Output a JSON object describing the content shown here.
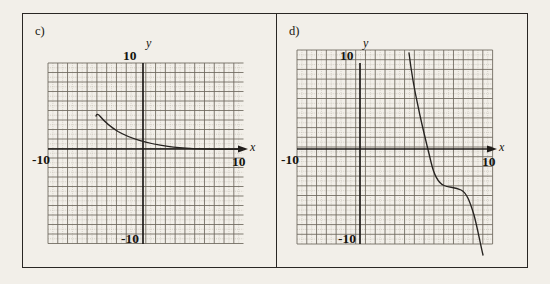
{
  "figure": {
    "background_color": "#f2efe9",
    "frame_color": "#2a2724",
    "curve_color": "#262320",
    "axis_color": "#1e1b18",
    "grid_major_color": "#6d675c",
    "grid_minor_color": "#b5afa2"
  },
  "panels": [
    {
      "id": "c",
      "label": "c)",
      "axis_labels": {
        "x": "x",
        "y": "y"
      },
      "ticks": {
        "x_min": "-10",
        "x_max": "10",
        "y_max": "10",
        "y_min": "-10"
      }
    },
    {
      "id": "d",
      "label": "d)",
      "axis_labels": {
        "x": "x",
        "y": "y"
      },
      "ticks": {
        "x_min": "-10",
        "x_max": "10",
        "y_max": "10",
        "y_min": "-10"
      }
    }
  ],
  "chart_data": [
    {
      "type": "line",
      "id": "c",
      "title": "c)",
      "xlabel": "x",
      "ylabel": "y",
      "xlim": [
        -10,
        10
      ],
      "ylim": [
        -10,
        10
      ],
      "grid": true,
      "grid_major_step": 2,
      "grid_minor_step": 1,
      "legend": "none",
      "description": "Decreasing concave-up curve beginning with a vertical tangent near x = -10 and falling slowly to the right, crossing below y = 0 near x = 10.",
      "x": [
        -9.9,
        -9.8,
        -9.5,
        -9.0,
        -8.0,
        -7.0,
        -6.0,
        -5.0,
        -4.0,
        -3.0,
        -2.0,
        -1.0,
        0.0,
        1.0,
        2.0,
        3.0,
        4.0,
        5.0,
        6.0,
        7.0,
        8.0,
        9.0,
        10.0
      ],
      "y": [
        6.6,
        6.2,
        5.7,
        5.2,
        4.6,
        4.1,
        3.7,
        3.4,
        3.0,
        2.7,
        2.4,
        2.1,
        1.8,
        1.6,
        1.3,
        1.1,
        0.9,
        0.7,
        0.5,
        0.3,
        0.2,
        0.1,
        0.0
      ]
    },
    {
      "type": "line",
      "id": "d",
      "title": "d)",
      "xlabel": "x",
      "ylabel": "y",
      "xlim": [
        -10,
        10
      ],
      "ylim": [
        -10,
        10
      ],
      "grid": true,
      "grid_major_step": 2,
      "grid_minor_step": 1,
      "legend": "none",
      "description": "Steeply decreasing curve with an inflection plateau near (3.5, -3); it falls from above y = 10 near x = 1.5 down through the plateau and then drops below y = -10 near x = 6.5.",
      "x": [
        1.4,
        1.6,
        1.8,
        2.0,
        2.2,
        2.4,
        2.6,
        2.8,
        3.0,
        3.2,
        3.4,
        3.6,
        3.8,
        4.0,
        4.4,
        4.8,
        5.2,
        5.6,
        6.0,
        6.3,
        6.5
      ],
      "y": [
        11.2,
        9.4,
        7.7,
        6.2,
        4.8,
        3.5,
        2.2,
        0.8,
        -0.8,
        -2.1,
        -2.8,
        -3.0,
        -3.1,
        -3.3,
        -3.8,
        -4.6,
        -5.8,
        -7.3,
        -9.2,
        -10.6,
        -11.5
      ]
    }
  ]
}
